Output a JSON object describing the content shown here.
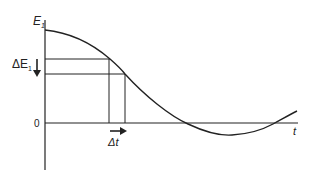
{
  "diagram": {
    "axes": {
      "y_label": "E",
      "y_label_subscript": "1",
      "x_label": "t",
      "origin_label": "0"
    },
    "annotations": {
      "delta_e_label": "ΔE",
      "delta_e_subscript": "1",
      "delta_t_label": "Δt"
    },
    "curve": {
      "description": "Decaying oscillation starting at E1, crossing zero, reaching a minimum and rising again",
      "points": [
        [
          45,
          30
        ],
        [
          110,
          58
        ],
        [
          125,
          74
        ],
        [
          188,
          123
        ],
        [
          232,
          135
        ],
        [
          273,
          123
        ],
        [
          297,
          112
        ]
      ]
    },
    "colors": {
      "line": "#222222",
      "background": "#ffffff"
    }
  }
}
